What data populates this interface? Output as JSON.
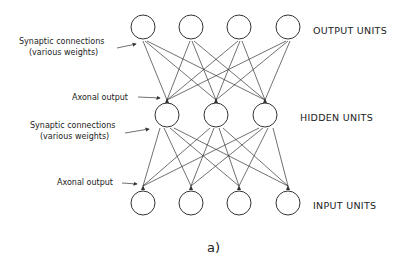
{
  "figure": {
    "caption": "a)",
    "layers": {
      "output": {
        "label": "OUTPUT UNITS",
        "count": 4
      },
      "hidden": {
        "label": "HIDDEN UNITS",
        "count": 3
      },
      "input": {
        "label": "INPUT UNITS",
        "count": 4
      }
    },
    "annotations": {
      "synaptic_top_line1": "Synaptic connections",
      "synaptic_top_line2": "(various weights)",
      "axonal_top": "Axonal output",
      "synaptic_bottom_line1": "Synaptic connections",
      "synaptic_bottom_line2": "(various weights)",
      "axonal_bottom": "Axonal output"
    }
  }
}
